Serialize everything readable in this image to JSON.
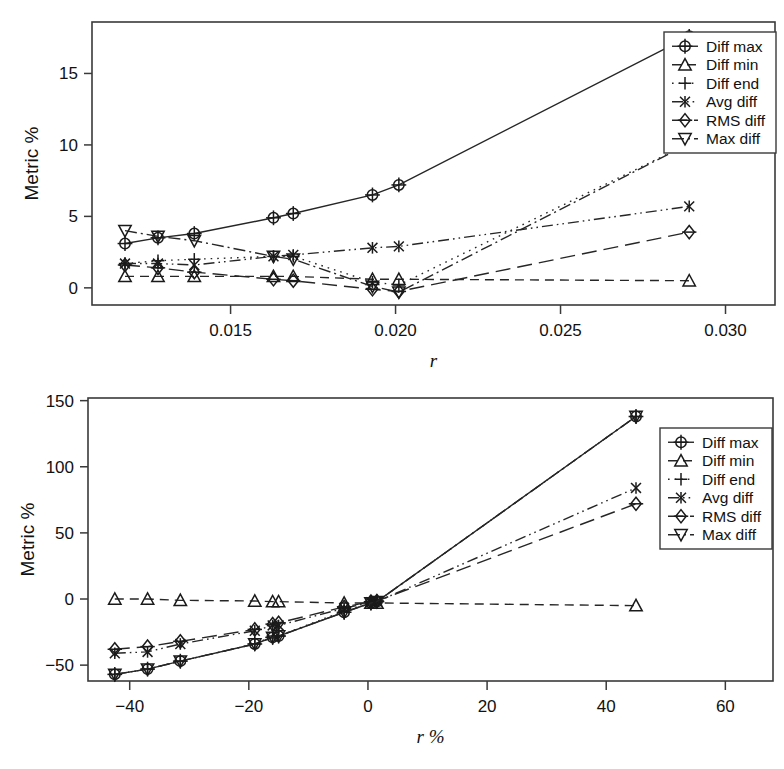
{
  "figure": {
    "background": "#ffffff",
    "ink_color": "#1a1a1a",
    "panel_count": 2
  },
  "legend_labels": {
    "diff_max": "Diff max",
    "diff_min": "Diff min",
    "diff_end": "Diff end",
    "avg_diff": "Avg diff",
    "rms_diff": "RMS diff",
    "max_diff": "Max diff"
  },
  "chart_data": [
    {
      "panel": "top",
      "type": "line",
      "title": "",
      "xlabel": "r",
      "ylabel": "Metric %",
      "xlim": [
        0.0108,
        0.0315
      ],
      "ylim": [
        -1.2,
        18.6
      ],
      "xticks": [
        0.015,
        0.02,
        0.025,
        0.03
      ],
      "xticklabels": [
        "0.015",
        "0.020",
        "0.025",
        "0.030"
      ],
      "yticks": [
        0,
        5,
        10,
        15
      ],
      "yticklabels": [
        "0",
        "5",
        "10",
        "15"
      ],
      "grid": false,
      "legend_position": "upper right",
      "x": [
        0.0118,
        0.0128,
        0.0139,
        0.0163,
        0.0169,
        0.0193,
        0.0201,
        0.0289
      ],
      "series": [
        {
          "name": "Diff max",
          "marker": "circle-plus",
          "linestyle": "solid",
          "values": [
            3.1,
            3.5,
            3.8,
            4.9,
            5.2,
            6.5,
            7.2,
            17.6
          ]
        },
        {
          "name": "Diff min",
          "marker": "triangle-up",
          "linestyle": "dashed",
          "values": [
            0.8,
            0.8,
            0.8,
            0.8,
            0.8,
            0.6,
            0.6,
            0.5
          ]
        },
        {
          "name": "Diff end",
          "marker": "plus",
          "linestyle": "dotted",
          "values": [
            1.7,
            1.9,
            2.0,
            2.2,
            2.2,
            0.4,
            0.2,
            10.1
          ]
        },
        {
          "name": "Avg diff",
          "marker": "asterisk",
          "linestyle": "dashdotdot",
          "values": [
            1.7,
            1.7,
            1.6,
            2.2,
            2.3,
            2.8,
            2.9,
            5.7
          ]
        },
        {
          "name": "RMS diff",
          "marker": "diamond-plus",
          "linestyle": "longdash",
          "values": [
            1.6,
            1.4,
            1.1,
            0.6,
            0.5,
            -0.1,
            -0.25,
            3.9
          ]
        },
        {
          "name": "Max diff",
          "marker": "triangle-down",
          "linestyle": "dashdot",
          "values": [
            4.0,
            3.6,
            3.3,
            2.2,
            2.0,
            0.1,
            -0.3,
            10.1
          ]
        }
      ]
    },
    {
      "panel": "bottom",
      "type": "line",
      "title": "",
      "xlabel": "r %",
      "ylabel": "Metric %",
      "xlim": [
        -47,
        68
      ],
      "ylim": [
        -62,
        152
      ],
      "xticks": [
        -40,
        -20,
        0,
        20,
        40,
        60
      ],
      "xticklabels": [
        "−40",
        "−20",
        "0",
        "20",
        "40",
        "60"
      ],
      "yticks": [
        -50,
        0,
        50,
        100,
        150
      ],
      "yticklabels": [
        "−50",
        "0",
        "50",
        "100",
        "150"
      ],
      "grid": false,
      "legend_position": "upper right",
      "x": [
        -42.5,
        -37,
        -31.5,
        -19,
        -16,
        -15,
        -4,
        0.5,
        1.5,
        45
      ],
      "series": [
        {
          "name": "Diff max",
          "marker": "circle-plus",
          "linestyle": "solid",
          "values": [
            -57,
            -53,
            -47,
            -34,
            -29,
            -28,
            -10,
            -3,
            -2,
            138
          ]
        },
        {
          "name": "Diff min",
          "marker": "triangle-up",
          "linestyle": "dashed",
          "values": [
            0,
            0,
            -1,
            -1.5,
            -2,
            -2,
            -3,
            -3,
            -3,
            -5
          ]
        },
        {
          "name": "Diff end",
          "marker": "plus",
          "linestyle": "dotted",
          "values": [
            -57,
            -53,
            -47,
            -34,
            -28,
            -28,
            -9,
            -3,
            -2,
            138
          ]
        },
        {
          "name": "Avg diff",
          "marker": "asterisk",
          "linestyle": "dashdotdot",
          "values": [
            -41,
            -40,
            -34,
            -24,
            -20,
            -20,
            -7,
            -2.5,
            -2,
            84
          ]
        },
        {
          "name": "RMS diff",
          "marker": "diamond-plus",
          "linestyle": "longdash",
          "values": [
            -38,
            -36,
            -32,
            -23,
            -19,
            -18,
            -6,
            -2,
            -1.5,
            72
          ]
        },
        {
          "name": "Max diff",
          "marker": "triangle-down",
          "linestyle": "dashdot",
          "values": [
            -57,
            -53,
            -47,
            -34,
            -29,
            -28,
            -10,
            -3,
            -2,
            138
          ]
        }
      ]
    }
  ]
}
